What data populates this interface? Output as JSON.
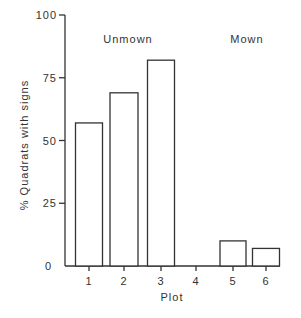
{
  "chart_data": {
    "type": "bar",
    "title": "",
    "xlabel": "Plot",
    "ylabel": "% Quadrats with signs",
    "categories": [
      "1",
      "2",
      "3",
      "4",
      "5",
      "6"
    ],
    "values": [
      57,
      69,
      82,
      0,
      10,
      7
    ],
    "ylim": [
      0,
      100
    ],
    "yticks": [
      "0",
      "25",
      "50",
      "75",
      "100"
    ],
    "grid": false,
    "annotations": [
      "Unmown",
      "Mown"
    ],
    "groups": [
      {
        "label": "Unmown",
        "plots": [
          "1",
          "2",
          "3"
        ]
      },
      {
        "label": "Mown",
        "plots": [
          "4",
          "5",
          "6"
        ]
      }
    ]
  }
}
